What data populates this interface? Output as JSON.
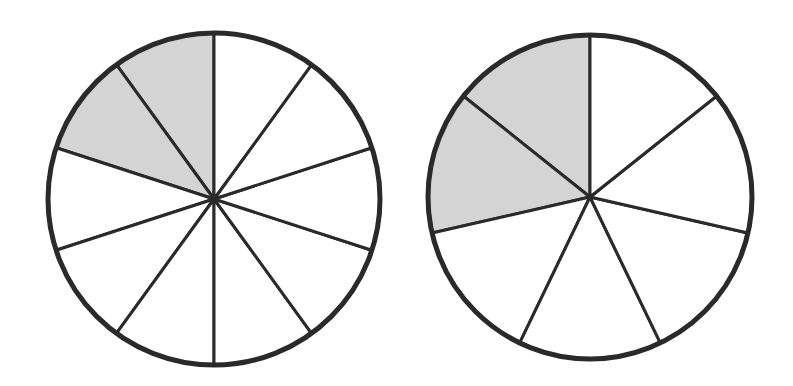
{
  "figure": {
    "stroke_color": "#2a2a2a",
    "shade_color": "#d4d4d4",
    "background": "#ffffff"
  },
  "circles": [
    {
      "id": "left",
      "cx": 214,
      "cy": 199,
      "r": 166,
      "sectors": 10,
      "shaded": 2,
      "fraction": "2/10",
      "start_angle_deg": 90,
      "shaded_sector_indices": [
        0,
        1
      ]
    },
    {
      "id": "right",
      "cx": 590,
      "cy": 197,
      "r": 162,
      "sectors": 7,
      "shaded": 2,
      "fraction": "2/7",
      "start_angle_deg": 90,
      "shaded_sector_indices": [
        0,
        1
      ]
    }
  ]
}
